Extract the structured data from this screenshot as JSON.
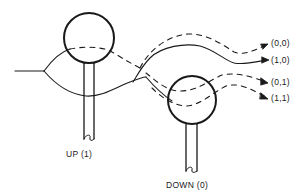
{
  "diagram": {
    "type": "path-splitting paths through two branching elements (Mach-Zehnder-like)",
    "colors": {
      "ink": "#1a1a1a",
      "background": "#ffffff"
    },
    "elements": [
      {
        "id": "up",
        "label": "UP (1)",
        "shape": "circle-on-stem"
      },
      {
        "id": "down",
        "label": "DOWN (0)",
        "shape": "circle-on-stem"
      }
    ],
    "outputs": [
      {
        "label": "(0,0)",
        "line_style": "dashed"
      },
      {
        "label": "(1,0)",
        "line_style": "solid"
      },
      {
        "label": "(0,1)",
        "line_style": "dashed"
      },
      {
        "label": "(1,1)",
        "line_style": "dashed"
      }
    ]
  }
}
